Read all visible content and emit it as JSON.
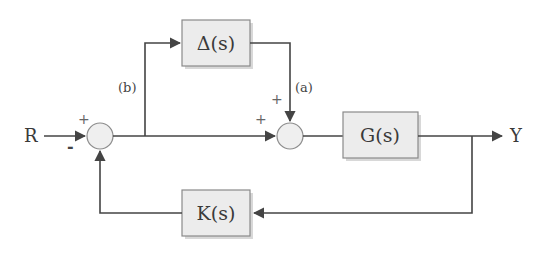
{
  "diagram": {
    "type": "control-block-diagram",
    "input": {
      "label": "R"
    },
    "output": {
      "label": "Y"
    },
    "blocks": [
      {
        "id": "delta",
        "label": "Δ(s)"
      },
      {
        "id": "plant",
        "label": "G(s)"
      },
      {
        "id": "controller",
        "label": "K(s)"
      }
    ],
    "summers": [
      {
        "id": "sum1",
        "signs": {
          "top": "+",
          "bottom": "-"
        }
      },
      {
        "id": "sum2",
        "signs": {
          "left": "+",
          "top": "+"
        }
      }
    ],
    "signal_labels": {
      "a": "(a)",
      "b": "(b)"
    },
    "colors": {
      "block_fill": "#ececec",
      "block_stroke": "#8a8a8a",
      "wire": "#444444",
      "text": "#3a3a3a"
    }
  }
}
